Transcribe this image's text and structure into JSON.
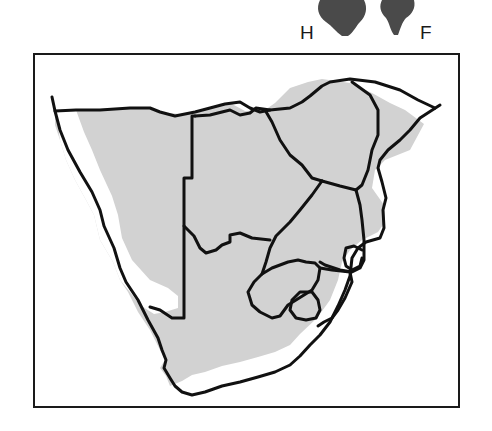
{
  "legend": {
    "hind_label": "H",
    "fore_label": "F",
    "hind_icon": "hind-footprint-icon",
    "fore_icon": "fore-footprint-icon"
  },
  "map": {
    "region": "Southern Africa",
    "range_fill_color": "#d2d2d2",
    "border_color": "#111111",
    "excluded_area_color": "#ffffff",
    "print_color": "#4a4a4a"
  }
}
